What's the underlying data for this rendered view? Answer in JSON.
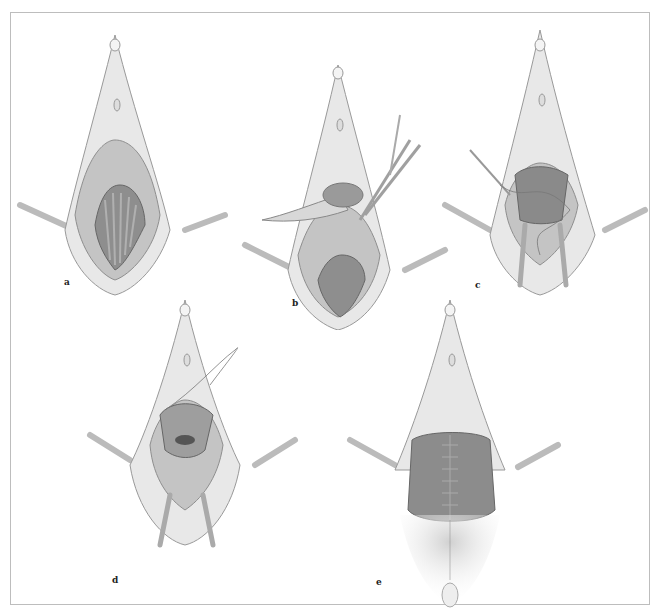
{
  "figure": {
    "panels": [
      {
        "id": "a",
        "label": "a",
        "description": "exposed field with retracted vaginal wall and rugae"
      },
      {
        "id": "b",
        "label": "b",
        "description": "flap lifted with forceps and incision with scissors"
      },
      {
        "id": "c",
        "label": "c",
        "description": "suture placement with needle holder, retracted flaps"
      },
      {
        "id": "d",
        "label": "d",
        "description": "continued suture, purse-string closure"
      },
      {
        "id": "e",
        "label": "e",
        "description": "completed midline closure"
      }
    ],
    "colors": {
      "background": "#ffffff",
      "frame": "#bdbdbd",
      "tissue_light": "#e6e6e6",
      "tissue_mid": "#bfbfbf",
      "tissue_dark": "#8c8c8c",
      "outline": "#9a9a9a"
    }
  }
}
